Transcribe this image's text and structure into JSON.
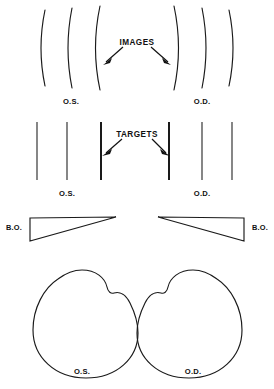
{
  "figure": {
    "ink_color": "#1a1a1a",
    "background_color": "#ffffff",
    "width": 274,
    "height": 389
  },
  "rows": {
    "images_row": {
      "label": "IMAGES",
      "left_eye_label": "O.S.",
      "right_eye_label": "O.D.",
      "arc_count": 6,
      "description": "six vertical arcs bowed away from centre"
    },
    "targets_row": {
      "label": "TARGETS",
      "left_eye_label": "O.S.",
      "right_eye_label": "O.D.",
      "line_count": 6,
      "description": "six straight vertical lines, inner pair heavier"
    },
    "prism_row": {
      "left_label": "B.O.",
      "right_label": "B.O.",
      "description": "two base-out prisms, bases facing outward"
    },
    "eyes_row": {
      "left_eye_label": "O.S.",
      "right_eye_label": "O.D.",
      "description": "two globe outlines with corneal bulge"
    }
  },
  "captions": [
    {
      "text": "IMAGES",
      "x": 137,
      "y": 39,
      "align": "center",
      "kind": "lbl-images"
    },
    {
      "text": "O.S.",
      "x": 71,
      "y": 98,
      "align": "center",
      "kind": ""
    },
    {
      "text": "O.D.",
      "x": 202,
      "y": 98,
      "align": "center",
      "kind": ""
    },
    {
      "text": "TARGETS",
      "x": 137,
      "y": 131,
      "align": "center",
      "kind": "lbl-targets"
    },
    {
      "text": "O.S.",
      "x": 67,
      "y": 190,
      "align": "center",
      "kind": ""
    },
    {
      "text": "O.D.",
      "x": 202,
      "y": 190,
      "align": "center",
      "kind": ""
    },
    {
      "text": "B.O.",
      "x": 14,
      "y": 229,
      "align": "center",
      "kind": "lbl-bo"
    },
    {
      "text": "B.O.",
      "x": 260,
      "y": 229,
      "align": "center",
      "kind": "lbl-bo"
    },
    {
      "text": "O.S.",
      "x": 82,
      "y": 370,
      "align": "center",
      "kind": ""
    },
    {
      "text": "O.D.",
      "x": 193,
      "y": 370,
      "align": "center",
      "kind": ""
    }
  ]
}
